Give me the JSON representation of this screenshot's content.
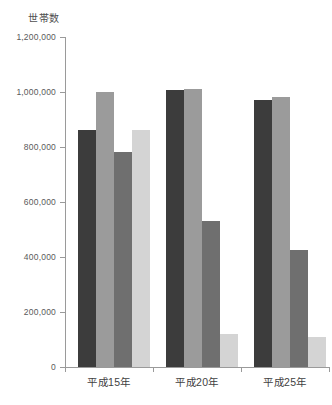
{
  "chart_data": {
    "type": "bar",
    "title": "",
    "ylabel": "世帯数",
    "xlabel": "",
    "categories": [
      "平成15年",
      "平成20年",
      "平成25年"
    ],
    "ylim": [
      0,
      1200000
    ],
    "ytick_labels": [
      "0",
      "200,000",
      "400,000",
      "600,000",
      "800,000",
      "1,000,000",
      "1,200,000"
    ],
    "ytick_values": [
      0,
      200000,
      400000,
      600000,
      800000,
      1000000,
      1200000
    ],
    "grid": false,
    "legend": "none",
    "series": [
      {
        "name": "series-1",
        "color": "#3c3c3c",
        "values": [
          862000,
          1007000,
          971000
        ]
      },
      {
        "name": "series-2",
        "color": "#9b9b9b",
        "values": [
          1000000,
          1011000,
          982000
        ]
      },
      {
        "name": "series-3",
        "color": "#6f6f6f",
        "values": [
          782000,
          531000,
          425000
        ]
      },
      {
        "name": "series-4",
        "color": "#d4d4d4",
        "values": [
          862000,
          120000,
          110000
        ]
      }
    ]
  },
  "axis": {
    "y_title": "世帯数",
    "tick_0": "0",
    "tick_1": "200,000",
    "tick_2": "400,000",
    "tick_3": "600,000",
    "tick_4": "800,000",
    "tick_5": "1,000,000",
    "tick_6": "1,200,000"
  },
  "categories": {
    "c0": "平成15年",
    "c1": "平成20年",
    "c2": "平成25年"
  }
}
